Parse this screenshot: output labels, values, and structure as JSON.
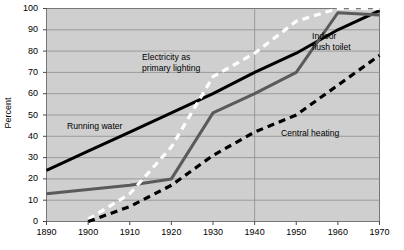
{
  "chart_data": {
    "type": "line",
    "title": "",
    "subtitle": "",
    "xlabel": "",
    "ylabel": "Percent",
    "xlim": [
      1890,
      1970
    ],
    "ylim": [
      0,
      100
    ],
    "grid": true,
    "legend_position": "inline-annotations",
    "x_ticks": [
      1890,
      1900,
      1910,
      1920,
      1930,
      1940,
      1950,
      1960,
      1970
    ],
    "y_ticks": [
      0,
      10,
      20,
      30,
      40,
      50,
      60,
      70,
      80,
      90,
      100
    ],
    "plot_background": "#cfcfcf",
    "series": [
      {
        "name": "Running water",
        "style": "solid",
        "color": "#000000",
        "x": [
          1890,
          1900,
          1910,
          1920,
          1930,
          1940,
          1950,
          1960,
          1970
        ],
        "values": [
          24,
          33,
          42,
          51,
          60,
          70,
          79,
          90,
          99
        ]
      },
      {
        "name": "Indoor flush toilet",
        "style": "solid",
        "color": "#5a5a5a",
        "x": [
          1890,
          1900,
          1910,
          1920,
          1930,
          1940,
          1950,
          1960,
          1970
        ],
        "values": [
          13,
          15,
          17,
          20,
          51,
          60,
          70,
          98,
          97
        ]
      },
      {
        "name": "Electricity as primary lighting",
        "style": "dashed",
        "color": "#ffffff",
        "x": [
          1900,
          1910,
          1920,
          1930,
          1940,
          1950,
          1960,
          1970
        ],
        "values": [
          1,
          13,
          35,
          68,
          79,
          94,
          100,
          100
        ]
      },
      {
        "name": "Central heating",
        "style": "dashed",
        "color": "#000000",
        "x": [
          1900,
          1910,
          1920,
          1930,
          1940,
          1950,
          1960,
          1970
        ],
        "values": [
          0,
          7,
          17,
          31,
          42,
          50,
          64,
          78
        ]
      }
    ],
    "annotations": [
      {
        "text": "Electricity as\nprimary lighting",
        "x_px": 142,
        "y_px": 52
      },
      {
        "text": "Indoor\nflush toilet",
        "x_px": 312,
        "y_px": 31
      },
      {
        "text": "Running water",
        "x_px": 67,
        "y_px": 121
      },
      {
        "text": "Central heating",
        "x_px": 281,
        "y_px": 128
      }
    ]
  },
  "axis": {
    "y_label": "Percent",
    "y_ticks": [
      "100",
      "90",
      "80",
      "70",
      "60",
      "50",
      "40",
      "30",
      "20",
      "10",
      "0"
    ],
    "x_ticks": [
      "1890",
      "1900",
      "1910",
      "1920",
      "1930",
      "1940",
      "1950",
      "1960",
      "1970"
    ]
  },
  "annotation_labels": {
    "electricity_line1": "Electricity as",
    "electricity_line2": "primary lighting",
    "indoor_line1": "Indoor",
    "indoor_line2": "flush toilet",
    "running_water": "Running water",
    "central_heating": "Central heating"
  }
}
